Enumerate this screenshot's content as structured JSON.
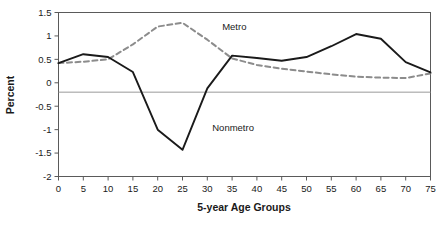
{
  "chart_data": {
    "type": "line",
    "title": "",
    "xlabel": "5-year Age Groups",
    "ylabel": "Percent",
    "xlim": [
      0,
      75
    ],
    "ylim": [
      -2,
      1.5
    ],
    "grid": false,
    "legend_position": "inline-annotations",
    "x": [
      0,
      5,
      10,
      15,
      20,
      25,
      30,
      35,
      40,
      45,
      50,
      55,
      60,
      65,
      70,
      75
    ],
    "xticklabels": [
      "0",
      "5",
      "10",
      "15",
      "20",
      "25",
      "30",
      "35",
      "40",
      "45",
      "50",
      "55",
      "60",
      "65",
      "70",
      "75"
    ],
    "yticks": [
      -2,
      -1.5,
      -1,
      -0.5,
      0,
      0.5,
      1,
      1.5
    ],
    "yticklabels": [
      "-2",
      "-1.5",
      "-1",
      "-0.5",
      "0",
      "0.5",
      "1",
      "1.5"
    ],
    "reference_line_y": -0.2,
    "series": [
      {
        "name": "Metro",
        "style": "dashed",
        "color": "#8c8c8c",
        "values": [
          0.42,
          0.45,
          0.5,
          0.82,
          1.2,
          1.28,
          0.92,
          0.52,
          0.38,
          0.3,
          0.24,
          0.18,
          0.13,
          0.11,
          0.1,
          0.2
        ]
      },
      {
        "name": "Nonmetro",
        "style": "solid",
        "color": "#1a1a1a",
        "values": [
          0.42,
          0.61,
          0.55,
          0.23,
          -1.0,
          -1.43,
          -0.12,
          0.58,
          0.53,
          0.47,
          0.55,
          0.78,
          1.04,
          0.94,
          0.44,
          0.22
        ]
      }
    ],
    "annotations": [
      {
        "text": "Metro",
        "x": 33,
        "y": 1.13
      },
      {
        "text": "Nonmetro",
        "x": 31,
        "y": -1.03
      }
    ]
  }
}
